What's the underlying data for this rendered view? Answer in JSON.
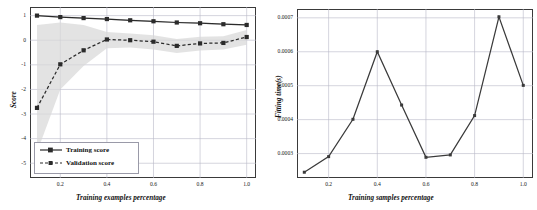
{
  "figure": {
    "background": "#ffffff",
    "panels": [
      "learning-curve",
      "fitting-time"
    ]
  },
  "chart_data": [
    {
      "id": "learning-curve",
      "type": "line",
      "title": "",
      "xlabel": "Training examples percentage",
      "ylabel": "Score",
      "xlim": [
        0.07,
        1.04
      ],
      "ylim": [
        -5.6,
        1.35
      ],
      "xticks": [
        0.2,
        0.4,
        0.6,
        0.8,
        1.0
      ],
      "xticklabels": [
        "0.2",
        "0.4",
        "0.6",
        "0.8",
        "1.0"
      ],
      "yticks": [
        1,
        0,
        -1,
        -2,
        -3,
        -4,
        -5
      ],
      "yticklabels": [
        "1",
        "0",
        "-1",
        "-2",
        "-3",
        "-4",
        "-5"
      ],
      "grid": true,
      "grid_color": "#b8b8c8",
      "legend_position": "lower left",
      "x": [
        0.1,
        0.2,
        0.3,
        0.4,
        0.5,
        0.6,
        0.7,
        0.8,
        0.9,
        1.0
      ],
      "series": [
        {
          "name": "Training score",
          "values": [
            1.0,
            0.94,
            0.9,
            0.86,
            0.81,
            0.77,
            0.72,
            0.69,
            0.65,
            0.62
          ],
          "color": "#2b2b2b",
          "linestyle": "solid",
          "marker": "square",
          "band_lower": [
            0.97,
            0.91,
            0.87,
            0.83,
            0.78,
            0.74,
            0.69,
            0.66,
            0.62,
            0.59
          ],
          "band_upper": [
            1.03,
            0.97,
            0.93,
            0.89,
            0.84,
            0.8,
            0.75,
            0.72,
            0.68,
            0.65
          ]
        },
        {
          "name": "Validation score",
          "values": [
            -2.75,
            -0.98,
            -0.41,
            0.03,
            0.0,
            -0.06,
            -0.23,
            -0.13,
            -0.11,
            0.13
          ],
          "color": "#2b2b2b",
          "linestyle": "dashed",
          "marker": "square",
          "band_lower": [
            -4.55,
            -2.0,
            -1.05,
            -0.33,
            -0.3,
            -0.38,
            -0.52,
            -0.42,
            -0.38,
            -0.18
          ],
          "band_upper": [
            0.62,
            0.72,
            0.62,
            0.33,
            0.27,
            0.2,
            0.05,
            0.14,
            0.16,
            0.42
          ]
        }
      ],
      "band_color": "#d8d8d8",
      "legend": [
        {
          "label": "Training score",
          "linestyle": "solid",
          "marker": "square"
        },
        {
          "label": "Validation score",
          "linestyle": "dashed",
          "marker": "square"
        }
      ]
    },
    {
      "id": "fitting-time",
      "type": "line",
      "title": "",
      "xlabel": "Training samples percentage",
      "ylabel": "Fitting time(s)",
      "xlim": [
        0.07,
        1.04
      ],
      "ylim": [
        0.000228,
        0.000726
      ],
      "xticks": [
        0.2,
        0.4,
        0.6,
        0.8,
        1.0
      ],
      "xticklabels": [
        "0.2",
        "0.4",
        "0.6",
        "0.8",
        "1.0"
      ],
      "yticks": [
        0.0003,
        0.0004,
        0.0005,
        0.0006,
        0.0007
      ],
      "yticklabels": [
        "0.0003",
        "0.0004",
        "0.0005",
        "0.0006",
        "0.0007"
      ],
      "grid": true,
      "grid_color": "#b8b8c8",
      "legend_position": "none",
      "x": [
        0.1,
        0.2,
        0.3,
        0.4,
        0.5,
        0.6,
        0.7,
        0.8,
        0.9,
        1.0
      ],
      "series": [
        {
          "name": "Fitting time",
          "values": [
            0.000245,
            0.000291,
            0.000401,
            0.0006,
            0.000443,
            0.000289,
            0.000296,
            0.000412,
            0.000703,
            0.000501
          ],
          "color": "#3a3a3a",
          "linestyle": "solid",
          "marker": "square"
        }
      ]
    }
  ]
}
